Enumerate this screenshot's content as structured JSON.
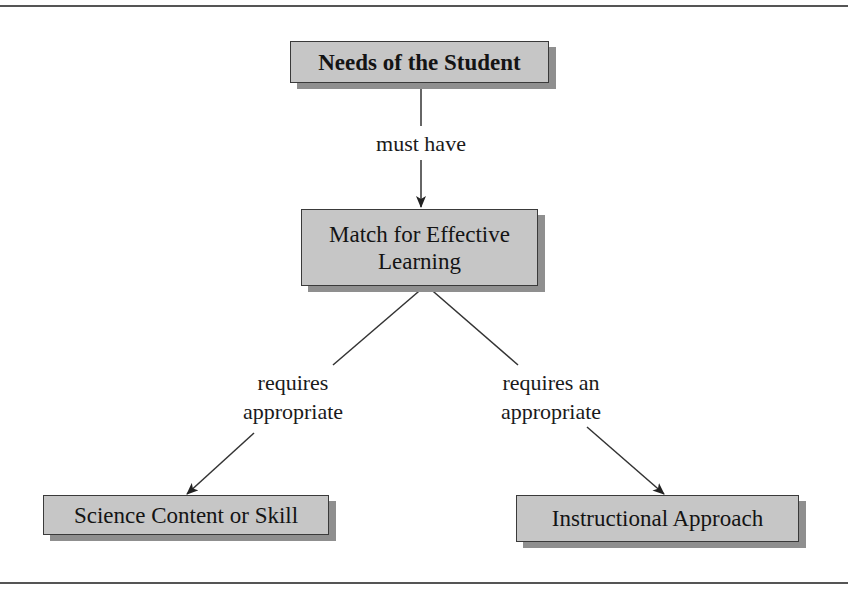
{
  "diagram": {
    "nodes": [
      {
        "id": "needs",
        "text": "Needs of the Student"
      },
      {
        "id": "match",
        "text_line1": "Match for Effective",
        "text_line2": "Learning"
      },
      {
        "id": "content",
        "text": "Science Content or Skill"
      },
      {
        "id": "approach",
        "text": "Instructional Approach"
      }
    ],
    "edges": [
      {
        "from": "needs",
        "to": "match",
        "label": "must have"
      },
      {
        "from": "match",
        "to": "content",
        "label_line1": "requires",
        "label_line2": "appropriate"
      },
      {
        "from": "match",
        "to": "approach",
        "label_line1": "requires an",
        "label_line2": "appropriate"
      }
    ],
    "colors": {
      "box_fill": "#c6c6c6",
      "box_border": "#3a3a3a",
      "box_shadow": "#8f8f8f",
      "line": "#333333",
      "rule": "#555555"
    }
  }
}
